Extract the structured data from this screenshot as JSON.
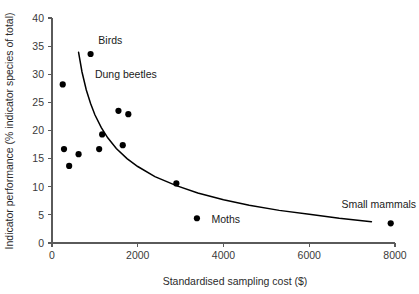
{
  "chart_data": {
    "type": "scatter",
    "title": "",
    "xlabel": "Standardised sampling cost ($)",
    "ylabel": "Indicator performance (% indicator species of total)",
    "xlim": [
      0,
      8000
    ],
    "ylim": [
      0,
      40
    ],
    "xticks": [
      0,
      2000,
      4000,
      6000,
      8000
    ],
    "yticks": [
      0,
      5,
      10,
      15,
      20,
      25,
      30,
      35,
      40
    ],
    "xtick_labels": [
      "0",
      "2000",
      "4000",
      "6000",
      "8000"
    ],
    "ytick_labels": [
      "0",
      "5",
      "10",
      "15",
      "20",
      "25",
      "30",
      "35",
      "40"
    ],
    "grid": false,
    "legend": "none",
    "points": [
      {
        "x": 250,
        "y": 28.2,
        "label": ""
      },
      {
        "x": 280,
        "y": 16.7,
        "label": ""
      },
      {
        "x": 400,
        "y": 13.7,
        "label": ""
      },
      {
        "x": 620,
        "y": 15.8,
        "label": ""
      },
      {
        "x": 900,
        "y": 33.6,
        "label": "Birds"
      },
      {
        "x": 1100,
        "y": 16.7,
        "label": ""
      },
      {
        "x": 1170,
        "y": 19.3,
        "label": ""
      },
      {
        "x": 1550,
        "y": 23.5,
        "label": ""
      },
      {
        "x": 1650,
        "y": 17.4,
        "label": ""
      },
      {
        "x": 1780,
        "y": 22.9,
        "label": ""
      },
      {
        "x": 2900,
        "y": 10.6,
        "label": ""
      },
      {
        "x": 3380,
        "y": 4.4,
        "label": "Moths"
      },
      {
        "x": 7900,
        "y": 3.5,
        "label": "Small mammals"
      }
    ],
    "annotations": [
      {
        "text": "Birds",
        "x": 1080,
        "y": 35.4
      },
      {
        "text": "Dung beetles",
        "x": 1000,
        "y": 29.3
      },
      {
        "text": "Moths",
        "x": 3720,
        "y": 3.5
      },
      {
        "text": "Small mammals",
        "x": 6750,
        "y": 6.3
      }
    ],
    "fit_curve": {
      "description": "decaying power-law trend line",
      "x_start": 620,
      "x_end": 7450,
      "points": [
        {
          "x": 620,
          "y": 33.9
        },
        {
          "x": 700,
          "y": 30.4
        },
        {
          "x": 800,
          "y": 27.2
        },
        {
          "x": 900,
          "y": 24.8
        },
        {
          "x": 1000,
          "y": 22.8
        },
        {
          "x": 1150,
          "y": 20.5
        },
        {
          "x": 1300,
          "y": 18.7
        },
        {
          "x": 1500,
          "y": 16.8
        },
        {
          "x": 1750,
          "y": 15.0
        },
        {
          "x": 2000,
          "y": 13.6
        },
        {
          "x": 2400,
          "y": 11.8
        },
        {
          "x": 2900,
          "y": 10.2
        },
        {
          "x": 3400,
          "y": 8.9
        },
        {
          "x": 4000,
          "y": 7.7
        },
        {
          "x": 4600,
          "y": 6.7
        },
        {
          "x": 5300,
          "y": 5.8
        },
        {
          "x": 6000,
          "y": 5.1
        },
        {
          "x": 6700,
          "y": 4.4
        },
        {
          "x": 7450,
          "y": 3.8
        }
      ]
    }
  }
}
